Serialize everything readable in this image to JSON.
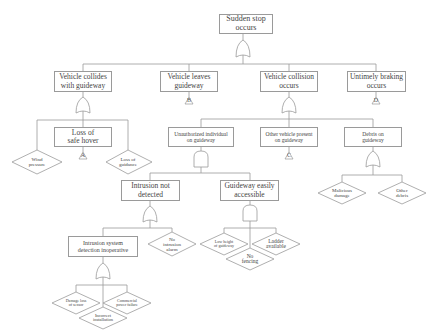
{
  "diagram": {
    "type": "fault_tree",
    "top_event": {
      "id": "top",
      "label": "Sudden stop occurs",
      "line1": "Sudden stop",
      "line2": "occurs",
      "gate": "OR"
    },
    "level1": [
      {
        "id": "collides",
        "line1": "Vehicle collides",
        "line2": "with guideway",
        "gate": "OR"
      },
      {
        "id": "leaves",
        "line1": "Vehicle leaves",
        "line2": "guideway",
        "transfer": "B"
      },
      {
        "id": "collision",
        "line1": "Vehicle collision",
        "line2": "occurs",
        "gate": "OR"
      },
      {
        "id": "braking",
        "line1": "Untimely braking",
        "line2": "occurs",
        "transfer": "D"
      }
    ],
    "collides_children": {
      "wind": {
        "line1": "Wind",
        "line2": "pressure",
        "kind": "undeveloped"
      },
      "hover": {
        "line1": "Loss of",
        "line2": "safe hover",
        "transfer": "A"
      },
      "guidance": {
        "line1": "Loss of",
        "line2": "guidance",
        "kind": "undeveloped"
      }
    },
    "collision_children": {
      "unauthorized": {
        "line1": "Unauthorized individual",
        "line2": "on guideway",
        "gate": "AND"
      },
      "other_vehicle": {
        "line1": "Other vehicle present",
        "line2": "on guideway",
        "transfer": "C"
      },
      "debris": {
        "line1": "Debris on",
        "line2": "guideway",
        "gate": "OR"
      }
    },
    "unauthorized_children": {
      "not_detected": {
        "line1": "Intrusion not",
        "line2": "detected",
        "gate": "OR"
      },
      "accessible": {
        "line1": "Guideway easily",
        "line2": "accessible",
        "gate": "AND"
      }
    },
    "debris_children": {
      "malicious": {
        "line1": "Malicious",
        "line2": "damage",
        "kind": "undeveloped"
      },
      "other": {
        "line1": "Other",
        "line2": "debris",
        "kind": "undeveloped"
      }
    },
    "not_detected_children": {
      "inoperative": {
        "line1": "Intrusion system",
        "line2": "detection inoperative",
        "gate": "OR"
      },
      "no_alarm": {
        "line1": "No",
        "line2": "intrusion",
        "line3": "alarm",
        "kind": "undeveloped"
      }
    },
    "accessible_children": {
      "low_height": {
        "line1": "Low height",
        "line2": "of guideway",
        "kind": "undeveloped"
      },
      "no_fencing": {
        "line1": "No",
        "line2": "fencing",
        "kind": "undeveloped"
      },
      "ladder": {
        "line1": "Ladder",
        "line2": "available",
        "kind": "undeveloped"
      }
    },
    "inoperative_children": {
      "damage": {
        "line1": "Damage loss",
        "line2": "of sensor",
        "kind": "undeveloped"
      },
      "incorrect": {
        "line1": "Incorrect",
        "line2": "installation",
        "kind": "undeveloped"
      },
      "power": {
        "line1": "Commercial",
        "line2": "power failure",
        "kind": "undeveloped"
      }
    },
    "colors": {
      "line": "#9a9a9a",
      "text": "#444444",
      "background": "#ffffff"
    }
  }
}
